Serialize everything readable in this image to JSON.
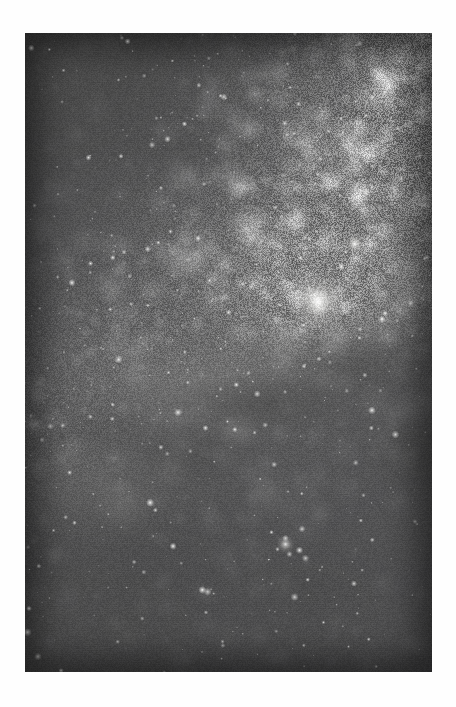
{
  "page": {
    "background_color": "#fefefe",
    "width": 456,
    "height": 707,
    "caption": ""
  },
  "photo": {
    "title": "",
    "alt_text": "Milky Way galactic centre star field",
    "subject": "Milky Way galactic center region",
    "medium": "grayscale astrophotograph",
    "frame": {
      "left": 25,
      "top": 33,
      "width": 407,
      "height": 639
    },
    "palette": {
      "sky_darkest": "#000000",
      "sky_dark": "#07070a",
      "sky_mid": "#1b1b1e",
      "nebula_mid": "#8b8a87",
      "nebula_bright": "#d8d7d3",
      "core_highlight": "#fcfbf8",
      "star_white": "#ffffff",
      "page_white": "#fefefe"
    },
    "features": [
      {
        "name": "galactic-core",
        "label": "Bright galactic bulge",
        "cx_pct": 72,
        "cy_pct": 42,
        "brightness": 0.95
      },
      {
        "name": "bright-star-upper-right",
        "label": "Prominent foreground star",
        "cx_pct": 81,
        "cy_pct": 33,
        "brightness": 1.0
      },
      {
        "name": "star-group-lower-centre",
        "label": "Bright star grouping",
        "cx_pct": 64,
        "cy_pct": 80,
        "brightness": 0.9
      },
      {
        "name": "great-rift-dust-lane",
        "label": "Dark dust lane (Great Rift)",
        "cx_pct": 60,
        "cy_pct": 58,
        "brightness": 0.05
      },
      {
        "name": "dark-nebula-upper-left",
        "label": "Dark nebula notch",
        "cx_pct": 38,
        "cy_pct": 18,
        "brightness": 0.04
      },
      {
        "name": "faint-glow-lower-left",
        "label": "Faint nebulosity",
        "cx_pct": 14,
        "cy_pct": 70,
        "brightness": 0.3
      }
    ],
    "band": {
      "description": "Diagonal Milky Way band running from lower-left to upper-right",
      "angle_deg": -22
    },
    "star_field": {
      "density": "very high",
      "bright_star_count": 64,
      "faint_star_count": 2600
    }
  }
}
